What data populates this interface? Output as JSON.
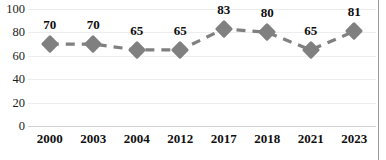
{
  "chart_data": {
    "type": "line",
    "title": "",
    "xlabel": "",
    "ylabel": "",
    "categories": [
      "2000",
      "2003",
      "2004",
      "2012",
      "2017",
      "2018",
      "2021",
      "2023"
    ],
    "values": [
      70,
      70,
      65,
      65,
      83,
      80,
      65,
      81
    ],
    "series": [
      {
        "name": "series-1",
        "values": [
          70,
          70,
          65,
          65,
          83,
          80,
          65,
          81
        ],
        "marker": "diamond",
        "line_style": "dashed",
        "color": "#808080"
      }
    ],
    "data_labels": [
      "70",
      "70",
      "65",
      "65",
      "83",
      "80",
      "65",
      "81"
    ],
    "ylim": [
      0,
      100
    ],
    "ytick_labels": [
      "0",
      "20",
      "40",
      "60",
      "80",
      "100"
    ],
    "ytick_values": [
      0,
      20,
      40,
      60,
      80,
      100
    ],
    "grid": true,
    "grid_axis": "y",
    "legend": false,
    "legend_position": "none"
  },
  "colors": {
    "series": "#808080",
    "gridline": "#ededed",
    "axis_line": "#d2d2d2",
    "frame": "#9a9a9a",
    "text": "#101010",
    "background": "#ffffff"
  },
  "title_remnant": {
    "text": ""
  }
}
